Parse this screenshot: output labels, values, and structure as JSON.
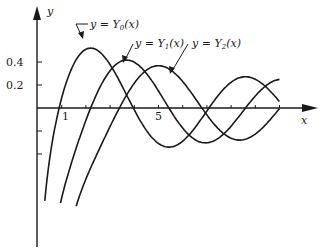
{
  "chart_data": {
    "type": "line",
    "title": "",
    "xlabel": "x",
    "ylabel": "y",
    "x_ticks": [
      1,
      2,
      3,
      4,
      5,
      6,
      7,
      8,
      9,
      10
    ],
    "x_tick_labels": {
      "1": "1",
      "5": "5"
    },
    "y_ticks": [
      0.2,
      0.4,
      -0.2,
      -0.4
    ],
    "y_tick_labels": {
      "0.2": "0.2",
      "0.4": "0.4"
    },
    "xlim": [
      0,
      11.3
    ],
    "ylim": [
      -1.2,
      0.87
    ],
    "grid": false,
    "legend": "inline annotations with arrows",
    "series": [
      {
        "name": "y = Y0(x)",
        "function": "Bessel Y0",
        "x_range": [
          0.3,
          10.0
        ],
        "peak": {
          "x": 2.2,
          "y": 0.52
        }
      },
      {
        "name": "y = Y1(x)",
        "function": "Bessel Y1",
        "x_range": [
          0.95,
          10.0
        ],
        "peak": {
          "x": 3.7,
          "y": 0.42
        }
      },
      {
        "name": "y = Y2(x)",
        "function": "Bessel Y2",
        "x_range": [
          1.6,
          10.0
        ],
        "peak": {
          "x": 5.0,
          "y": 0.37
        }
      }
    ],
    "annotations": [
      {
        "text_prefix": "y = Y",
        "sub": "0",
        "suffix": "(x)"
      },
      {
        "text_prefix": "y = Y",
        "sub": "1",
        "suffix": "(x)"
      },
      {
        "text_prefix": "y = Y",
        "sub": "2",
        "suffix": "(x)"
      }
    ]
  },
  "axes": {
    "x_label": "x",
    "y_label": "y",
    "tick_1": "1",
    "tick_5": "5",
    "tick_04": "0.4",
    "tick_02": "0.2"
  },
  "labels": {
    "y0": {
      "pre": "y = Y",
      "sub": "0",
      "post": "(x)"
    },
    "y1": {
      "pre": "y = Y",
      "sub": "1",
      "post": "(x)"
    },
    "y2": {
      "pre": "y = Y",
      "sub": "2",
      "post": "(x)"
    }
  }
}
